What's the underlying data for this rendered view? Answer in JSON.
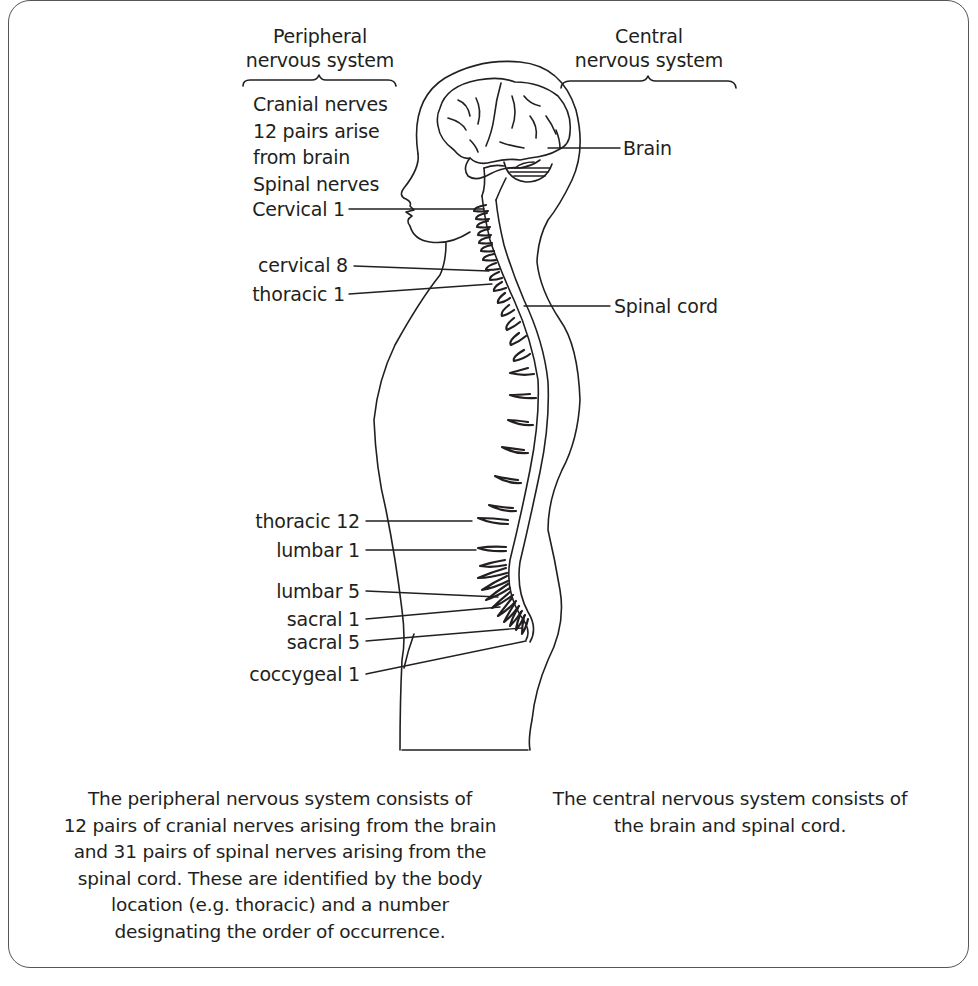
{
  "headers": {
    "peripheral": {
      "line1": "Peripheral",
      "line2": "nervous system"
    },
    "central": {
      "line1": "Central",
      "line2": "nervous system"
    }
  },
  "peripheral_labels": {
    "cranial_title": "Cranial nerves",
    "cranial_line2": "12 pairs arise",
    "cranial_line3": "from brain",
    "spinal_title": "Spinal nerves"
  },
  "nerve_labels": [
    {
      "id": "cervical-1",
      "text": "Cervical 1"
    },
    {
      "id": "cervical-8",
      "text": "cervical 8"
    },
    {
      "id": "thoracic-1",
      "text": "thoracic 1"
    },
    {
      "id": "thoracic-12",
      "text": "thoracic 12"
    },
    {
      "id": "lumbar-1",
      "text": "lumbar 1"
    },
    {
      "id": "lumbar-5",
      "text": "lumbar 5"
    },
    {
      "id": "sacral-1",
      "text": "sacral 1"
    },
    {
      "id": "sacral-5",
      "text": "sacral 5"
    },
    {
      "id": "coccygeal-1",
      "text": "coccygeal 1"
    }
  ],
  "central_labels": {
    "brain": "Brain",
    "spinal_cord": "Spinal cord"
  },
  "captions": {
    "peripheral": [
      "The peripheral nervous system consists of",
      "12 pairs of cranial nerves arising from the brain",
      "and 31 pairs of spinal nerves arising from the",
      "spinal cord. These are identified by the body",
      "location (e.g. thoracic) and a number",
      "designating the order of occurrence."
    ],
    "central": [
      "The central nervous system consists of",
      "the brain and spinal cord."
    ]
  },
  "colors": {
    "line": "#231f20",
    "frame": "#555555",
    "background": "#ffffff"
  }
}
